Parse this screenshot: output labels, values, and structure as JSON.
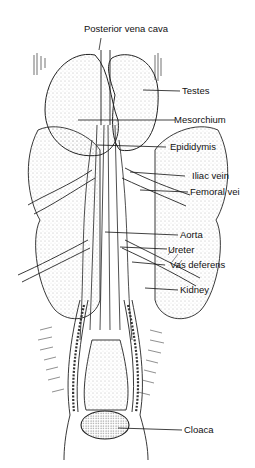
{
  "diagram": {
    "labels": [
      {
        "id": "posterior-vena-cava",
        "text": "Posterior vena cava"
      },
      {
        "id": "testes",
        "text": "Testes"
      },
      {
        "id": "mesorchium",
        "text": "Mesorchium"
      },
      {
        "id": "epididymis",
        "text": "Epididymis"
      },
      {
        "id": "iliac-vein",
        "text": "Iliac vein"
      },
      {
        "id": "femoral-vein",
        "text": "Femoral vei"
      },
      {
        "id": "aorta",
        "text": "Aorta"
      },
      {
        "id": "ureter",
        "text": "Ureter"
      },
      {
        "id": "vas-deferens",
        "text": "Vas deferens"
      },
      {
        "id": "kidney",
        "text": "Kidney"
      },
      {
        "id": "cloaca",
        "text": "Cloaca"
      }
    ]
  }
}
